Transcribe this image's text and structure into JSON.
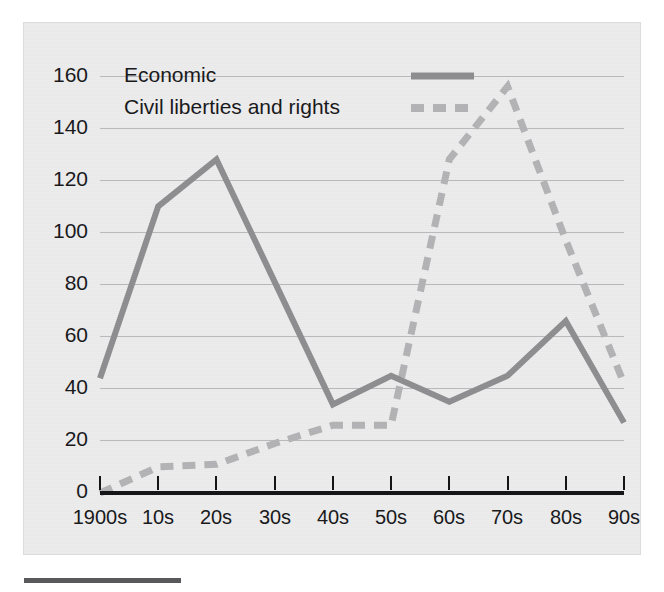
{
  "figure": {
    "background_color": "#ececed",
    "page_color": "#ffffff",
    "border_color": "#dcdcdd",
    "axis_color": "#141416",
    "grid_color": "#b9b9bb"
  },
  "chart_data": {
    "type": "line",
    "title": "",
    "subtitle": "",
    "xlabel": "",
    "ylabel": "",
    "categories": [
      "1900s",
      "10s",
      "20s",
      "30s",
      "40s",
      "50s",
      "60s",
      "70s",
      "80s",
      "90s"
    ],
    "series": [
      {
        "name": "Economic",
        "color": "#8e8e90",
        "style": "solid",
        "values": [
          44,
          110,
          128,
          81,
          34,
          45,
          35,
          45,
          66,
          27
        ]
      },
      {
        "name": "Civil liberties and rights",
        "color": "#b3b3b5",
        "style": "dashed",
        "values": [
          0,
          10,
          11,
          19,
          26,
          26,
          128,
          156,
          97,
          42
        ]
      }
    ],
    "yticks": [
      0,
      20,
      40,
      60,
      80,
      100,
      120,
      140,
      160
    ],
    "ytick_labels": [
      "0",
      "20",
      "40",
      "60",
      "80",
      "100",
      "120",
      "140",
      "160"
    ],
    "ylim": [
      0,
      168
    ],
    "grid": "horizontal",
    "legend_position": "top-left",
    "legend": [
      {
        "label": "Economic",
        "swatch": "solid-line-swatch"
      },
      {
        "label": "Civil liberties and rights",
        "swatch": "dashed-line-swatch"
      }
    ]
  }
}
